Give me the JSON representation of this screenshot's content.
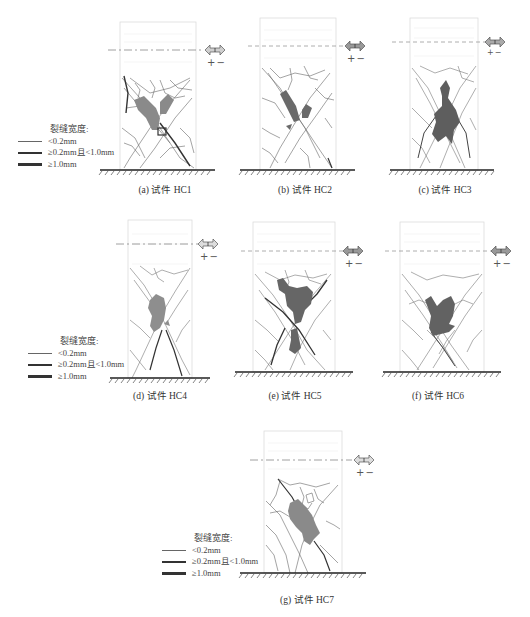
{
  "legend": {
    "title": "裂缝宽度:",
    "items": [
      {
        "label": "<0.2mm",
        "width": 1
      },
      {
        "label": "≥0.2mm且<1.0mm",
        "width": 2
      },
      {
        "label": "≥1.0mm",
        "width": 3
      }
    ]
  },
  "load_direction": {
    "symbol": "+−",
    "arrow": "double-arrow"
  },
  "colors": {
    "damage_fill": "#7a7a7a",
    "crack": "#555555",
    "outline": "#d8d8d8",
    "ground": "#222222"
  },
  "panels": [
    {
      "id": "a",
      "caption": "(a) 试件 HC1",
      "damage_shade": "#8a8a8a"
    },
    {
      "id": "b",
      "caption": "(b) 试件 HC2",
      "damage_shade": "#6a6a6a"
    },
    {
      "id": "c",
      "caption": "(c) 试件 HC3",
      "damage_shade": "#5e5e5e"
    },
    {
      "id": "d",
      "caption": "(d) 试件 HC4",
      "damage_shade": "#8e8e8e"
    },
    {
      "id": "e",
      "caption": "(e) 试件 HC5",
      "damage_shade": "#666666"
    },
    {
      "id": "f",
      "caption": "(f) 试件 HC6",
      "damage_shade": "#626262"
    },
    {
      "id": "g",
      "caption": "(g) 试件 HC7",
      "damage_shade": "#8a8a8a"
    }
  ]
}
